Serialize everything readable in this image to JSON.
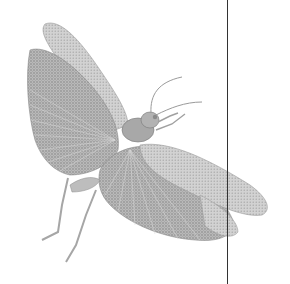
{
  "image": {
    "subject": "grasshopper engraving",
    "description": "Monochrome stippled engraving of a grasshopper/locust with wings spread, viewed from below-front, legs hanging down",
    "colors": {
      "background": "#ffffff",
      "ink_dark": "#6f6f6f",
      "ink_mid": "#9a9a9a",
      "ink_light": "#c4c4c4",
      "rule_line": "#333333"
    },
    "rule_line_x": 227
  }
}
